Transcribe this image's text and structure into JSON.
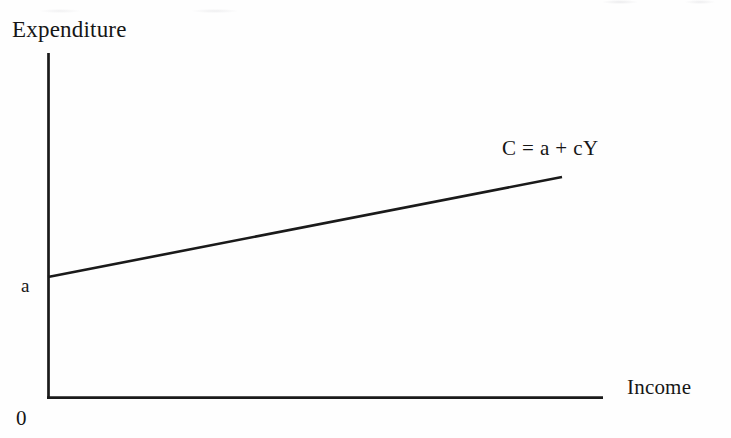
{
  "figure": {
    "background_color": "#fefefe",
    "ink_color": "#161616",
    "axis_color": "#1a1a1a"
  },
  "labels": {
    "y_axis_title": "Expenditure",
    "x_axis_title": "Income",
    "origin": "0",
    "intercept": "a",
    "curve_equation": "C = a + cY"
  },
  "chart_data": {
    "type": "line",
    "title": "",
    "subtitle": "",
    "xlabel": "Income",
    "ylabel": "Expenditure",
    "grid": false,
    "legend": "none",
    "axis_style": "open-l-shape",
    "xlim": [
      0,
      1
    ],
    "ylim": [
      0,
      1
    ],
    "x_tick_labels": [
      "0"
    ],
    "y_tick_labels": [
      "a"
    ],
    "annotations": [
      {
        "text": "C = a + cY",
        "x_px": 502,
        "y_px": 138,
        "describes_series": "consumption-function"
      },
      {
        "text": "a",
        "x_px": 21,
        "y_px": 276,
        "describes": "vertical-intercept"
      },
      {
        "text": "0",
        "x_px": 16,
        "y_px": 408,
        "describes": "origin"
      }
    ],
    "series": [
      {
        "name": "consumption-function",
        "equation": "C = a + cY",
        "intercept_label": "a",
        "slope_label": "c",
        "x": [
          0,
          1
        ],
        "y": [
          0.35,
          0.64
        ],
        "pixel_start": [
          48,
          277
        ],
        "pixel_end": [
          562,
          177
        ],
        "color": "#1a1a1a",
        "width_px": 2.6
      }
    ],
    "axes_geometry": {
      "y_axis_px": {
        "x": 48,
        "y_top": 53,
        "y_bottom": 399
      },
      "x_axis_px": {
        "y": 398,
        "x_left": 47,
        "x_right": 603
      }
    }
  }
}
